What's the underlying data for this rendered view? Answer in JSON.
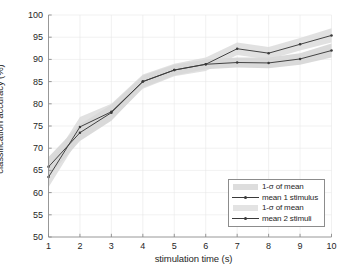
{
  "chart_data": {
    "type": "line",
    "title": "",
    "xlabel": "stimulation time (s)",
    "ylabel": "classification accuracy (%)",
    "xlim": [
      1,
      10
    ],
    "ylim": [
      50,
      100
    ],
    "xticks": [
      1,
      2,
      3,
      4,
      5,
      6,
      7,
      8,
      9,
      10
    ],
    "yticks": [
      50,
      55,
      60,
      65,
      70,
      75,
      80,
      85,
      90,
      95,
      100
    ],
    "grid": true,
    "legend_position": "lower right",
    "x": [
      1,
      2,
      3,
      4,
      5,
      6,
      7,
      8,
      9,
      10
    ],
    "series": [
      {
        "name": "mean 1 stimulus",
        "type": "line",
        "marker": "dot",
        "color": "#3a3a3a",
        "values": [
          65.8,
          73.5,
          78.0,
          85.0,
          87.6,
          88.9,
          89.3,
          89.2,
          90.1,
          92.0
        ],
        "band_name": "1-σ of mean",
        "band_color": "#d0d0d0",
        "band_lower": [
          63.6,
          71.6,
          76.2,
          83.6,
          86.4,
          87.8,
          88.2,
          88.0,
          88.8,
          90.4
        ],
        "band_upper": [
          68.0,
          75.4,
          79.8,
          86.4,
          88.8,
          90.0,
          90.4,
          90.4,
          91.4,
          93.6
        ]
      },
      {
        "name": "mean 2 stimuli",
        "type": "line",
        "marker": "dot",
        "color": "#3a3a3a",
        "values": [
          63.5,
          74.8,
          78.2,
          85.0,
          87.6,
          88.9,
          92.4,
          91.4,
          93.4,
          95.4
        ],
        "band_name": "1-σ of mean",
        "band_color": "#d8d8d8",
        "band_lower": [
          61.2,
          72.6,
          76.4,
          83.4,
          86.2,
          87.4,
          91.0,
          90.0,
          92.0,
          93.8
        ],
        "band_upper": [
          65.8,
          77.0,
          80.0,
          86.6,
          89.0,
          90.4,
          93.8,
          92.8,
          94.8,
          97.0
        ]
      }
    ],
    "legend": [
      {
        "label": "1-σ of mean",
        "kind": "band"
      },
      {
        "label": "mean 1 stimulus",
        "kind": "line"
      },
      {
        "label": "1-σ of mean",
        "kind": "band"
      },
      {
        "label": "mean 2 stimuli",
        "kind": "line"
      }
    ]
  },
  "axis": {
    "ytick_labels": [
      "100",
      "95",
      "90",
      "85",
      "80",
      "75",
      "70",
      "65",
      "60",
      "55",
      "50"
    ],
    "xtick_labels": [
      "1",
      "2",
      "3",
      "4",
      "5",
      "6",
      "7",
      "8",
      "9",
      "10"
    ]
  }
}
